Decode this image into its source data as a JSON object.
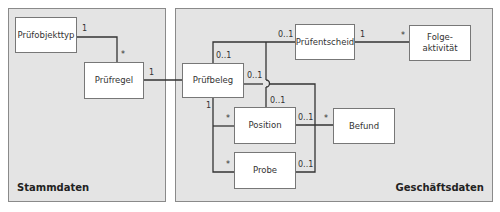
{
  "panels": {
    "master": {
      "label": "Stammdaten"
    },
    "business": {
      "label": "Geschäftsdaten"
    }
  },
  "entities": {
    "pruefobjekttyp": "Prüfobjekttyp",
    "pruefregel": "Prüfregel",
    "pruefbeleg": "Prüfbeleg",
    "pruefentscheid": "Prüfentscheid",
    "folgeaktivitaet": "Folge-\naktivität",
    "position": "Position",
    "befund": "Befund",
    "probe": "Probe"
  },
  "multiplicities": {
    "objekttyp_regel_src": "1",
    "objekttyp_regel_dst": "*",
    "regel_beleg_src": "1",
    "beleg_entscheid_src": "0..1",
    "beleg_entscheid_dst": "0..1",
    "entscheid_folge_src": "1",
    "entscheid_folge_dst": "*",
    "beleg_right": "0..1",
    "position_top": "0..1",
    "beleg_bottom": "1",
    "position_left": "*",
    "probe_left": "*",
    "position_right": "0..1",
    "befund_left": "*",
    "probe_right": "0..1"
  }
}
